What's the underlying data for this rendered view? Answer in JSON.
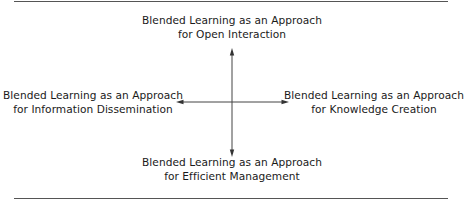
{
  "diagram": {
    "top": {
      "line1": "Blended Learning as an Approach",
      "line2": "for Open Interaction"
    },
    "bottom": {
      "line1": "Blended Learning as an Approach",
      "line2": "for Efficient Management"
    },
    "left": {
      "line1": "Blended Learning as an Approach",
      "line2": "for Information Dissemination"
    },
    "right": {
      "line1": "Blended Learning as an Approach",
      "line2": "for Knowledge Creation"
    },
    "colors": {
      "text": "#1a1a1a",
      "arrow": "#444444",
      "rule": "#555555"
    }
  }
}
